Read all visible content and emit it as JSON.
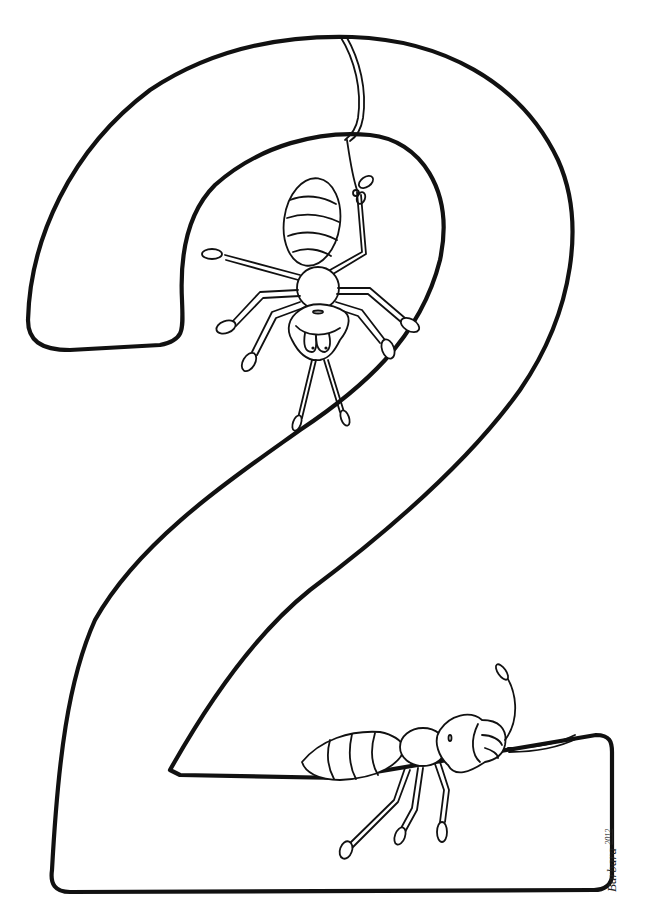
{
  "image": {
    "subject": "Coloring page of the number 2 decorated with two cartoon ants",
    "background_color": "#ffffff",
    "line_color": "#111111"
  },
  "figures": {
    "numeral": {
      "label": "number-two-outline",
      "value": "2"
    },
    "hanging_ant": {
      "label": "ant hanging upside down from a string tied to its leg"
    },
    "resting_ant": {
      "label": "ant lying on the base of the number 2"
    }
  },
  "signature": {
    "name": "Barbara",
    "year": "2012"
  }
}
